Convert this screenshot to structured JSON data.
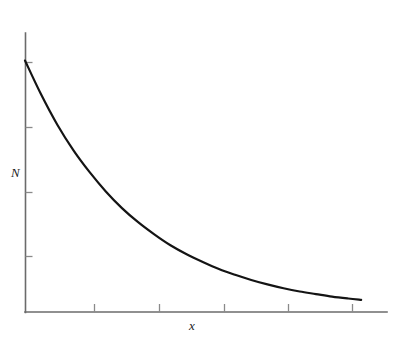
{
  "figure": {
    "name": "exponential-decay-plot",
    "background_color": "#ffffff",
    "axis_color": "#6b6b6b",
    "tick_color": "#8a8a8a",
    "curve_color": "#141414",
    "y_axis_label": "N",
    "x_axis_label": "x",
    "title": "",
    "subtitle": ""
  },
  "chart_data": {
    "type": "line",
    "title": "",
    "xlabel": "x",
    "ylabel": "N",
    "grid": false,
    "legend": false,
    "legend_position": "none",
    "xlim": [
      0,
      5.6
    ],
    "ylim": [
      0,
      4.35
    ],
    "x_ticks": [
      1,
      2,
      3,
      4,
      5
    ],
    "x_tick_labels": [
      "",
      "",
      "",
      "",
      ""
    ],
    "y_ticks": [
      1,
      2,
      3,
      4
    ],
    "y_tick_labels": [
      "",
      "",
      "",
      ""
    ],
    "series": [
      {
        "name": "N(x)",
        "description": "exponential decay",
        "color": "#141414",
        "x": [
          0.0,
          0.25,
          0.5,
          0.75,
          1.0,
          1.25,
          1.5,
          1.75,
          2.0,
          2.25,
          2.5,
          2.75,
          3.0,
          3.25,
          3.5,
          3.75,
          4.0,
          4.25,
          4.5,
          4.75,
          5.0,
          5.2
        ],
        "values": [
          3.92,
          3.39,
          2.92,
          2.52,
          2.18,
          1.88,
          1.62,
          1.4,
          1.21,
          1.04,
          0.9,
          0.78,
          0.67,
          0.58,
          0.5,
          0.43,
          0.37,
          0.32,
          0.28,
          0.24,
          0.21,
          0.19
        ]
      }
    ]
  },
  "geometry": {
    "origin_x": 25,
    "origin_y": 312,
    "y_axis_top": 33,
    "x_axis_right": 387,
    "curve_start": [
      25,
      62
    ],
    "curve_end": [
      360,
      302
    ],
    "x_tick_positions": [
      94,
      159,
      224,
      288,
      352
    ],
    "y_tick_positions": [
      62,
      127,
      192,
      256
    ],
    "tick_length": 7
  }
}
